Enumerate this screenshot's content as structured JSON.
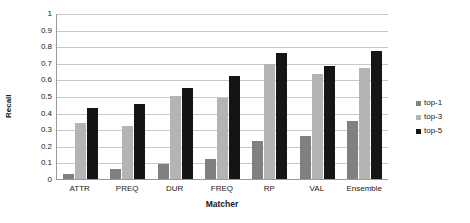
{
  "chart_data": {
    "type": "bar",
    "title": "",
    "xlabel": "Matcher",
    "ylabel": "Recall",
    "categories": [
      "ATTR",
      "PREQ",
      "DUR",
      "FREQ",
      "RP",
      "VAL",
      "Ensemble"
    ],
    "series": [
      {
        "name": "top-1",
        "color": "#808080",
        "values": [
          0.03,
          0.06,
          0.09,
          0.12,
          0.23,
          0.26,
          0.35
        ]
      },
      {
        "name": "top-3",
        "color": "#b4b4b4",
        "values": [
          0.34,
          0.32,
          0.5,
          0.49,
          0.69,
          0.63,
          0.67
        ]
      },
      {
        "name": "top-5",
        "color": "#151515",
        "values": [
          0.43,
          0.45,
          0.55,
          0.62,
          0.76,
          0.68,
          0.77
        ]
      }
    ],
    "ylim": [
      0,
      1
    ],
    "ytick_labels": [
      "1",
      "0.9",
      "0.8",
      "0.7",
      "0.6",
      "0.5",
      "0.4",
      "0.3",
      "0.2",
      "0.1",
      "0"
    ],
    "ytick_values": [
      1,
      0.9,
      0.8,
      0.7,
      0.6,
      0.5,
      0.4,
      0.3,
      0.2,
      0.1,
      0
    ],
    "grid": true,
    "legend_position": "right",
    "legend": [
      "top-1",
      "top-3",
      "top-5"
    ]
  }
}
